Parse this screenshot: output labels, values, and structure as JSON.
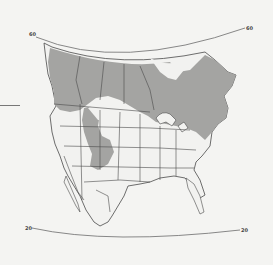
{
  "map": {
    "type": "range-map",
    "region": "North America",
    "projection_labels": {
      "top_left": "60",
      "top_right": "60",
      "bottom_left": "20",
      "bottom_right": "20"
    },
    "legend": [],
    "colors": {
      "background": "#f4f4f2",
      "range_fill": "#a4a4a2",
      "land_fill": "#f2f2f0",
      "border": "#4a4a4a",
      "graticule": "#7a7a7a"
    },
    "shaded_range_description": "Southern Canada and northern/northeastern United States, plus a southward extension through the Rocky Mountains"
  }
}
